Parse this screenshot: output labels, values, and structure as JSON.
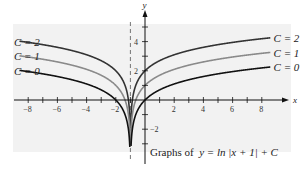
{
  "chart_data": {
    "type": "line",
    "xlabel": "x",
    "ylabel": "y",
    "xlim": [
      -9,
      9.5
    ],
    "ylim": [
      -3.2,
      6.5
    ],
    "x_ticks": [
      -8,
      -6,
      -4,
      -2,
      2,
      4,
      6,
      8
    ],
    "y_ticks": [
      -2,
      2,
      4
    ],
    "asymptote_x": -1,
    "series": [
      {
        "name": "C = 2",
        "C": 2,
        "color": "#333333"
      },
      {
        "name": "C = 1",
        "C": 1,
        "color": "#8a8a8a"
      },
      {
        "name": "C = 0",
        "C": 0,
        "color": "#111111"
      }
    ],
    "grid": false
  },
  "labels": {
    "left": [
      "C = 2",
      "C = 1",
      "C = 0"
    ],
    "right": [
      "C = 2",
      "C = 1",
      "C = 0"
    ],
    "caption_prefix": "Graphs of",
    "caption_formula": "y = ln |x + 1| + C"
  }
}
